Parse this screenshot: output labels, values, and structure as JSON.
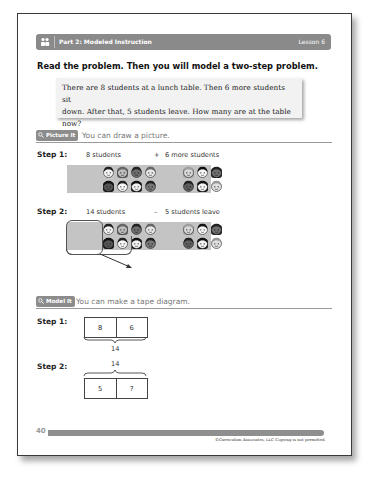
{
  "header": {
    "icon": "students-icon",
    "title": "Part 2: Modeled Instruction",
    "lesson": "Lesson 6"
  },
  "intro": "Read the problem. Then you will model a two-step problem.",
  "problem": {
    "line1": "There are 8 students at a lunch table. Then 6 more students sit",
    "line2": "down. After that, 5 students leave. How many are at the table now?"
  },
  "picture_it": {
    "badge": "Picture It",
    "label": "You can draw a picture.",
    "step1": {
      "label": "Step 1:",
      "left_caption": "8 students",
      "operator": "+",
      "right_caption": "6 more students",
      "left_count": 8,
      "right_count": 6
    },
    "step2": {
      "label": "Step 2:",
      "left_caption": "14 students",
      "operator": "–",
      "right_caption": "5 students leave",
      "circled_count": 5
    }
  },
  "model_it": {
    "badge": "Model It",
    "label": "You can make a tape diagram.",
    "step1": {
      "label": "Step 1:",
      "cells": [
        "8",
        "6"
      ],
      "total": "14"
    },
    "step2": {
      "label": "Step 2:",
      "cells": [
        "5",
        "?"
      ],
      "total": "14"
    }
  },
  "footer": {
    "page_number": "40",
    "copyright": "©Curriculum Associates, LLC   Copying is not permitted."
  },
  "colors": {
    "header_bar": "#8a8a8a",
    "badge": "#8c8c8c",
    "problem_box": "#f2f2f2",
    "band": "#c4c4c4"
  }
}
